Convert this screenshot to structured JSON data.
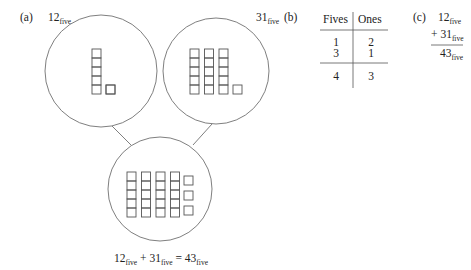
{
  "panel_a": {
    "label": "(a)",
    "left_circle": {
      "value": "12",
      "base": "five",
      "fives_columns": 1,
      "ones_units": 2
    },
    "right_circle": {
      "value": "31",
      "base": "five",
      "fives_columns": 3,
      "ones_units": 1
    },
    "bottom_circle": {
      "fives_columns": 4,
      "ones_units": 3
    },
    "equation": {
      "a": "12",
      "a_base": "five",
      "plus": "+",
      "b": "31",
      "b_base": "five",
      "equals": "=",
      "sum": "43",
      "sum_base": "five"
    }
  },
  "panel_b": {
    "label": "(b)",
    "headers": [
      "Fives",
      "Ones"
    ],
    "rows": [
      [
        "1",
        "2"
      ],
      [
        "3",
        "1"
      ]
    ],
    "total": [
      "4",
      "3"
    ]
  },
  "panel_c": {
    "label": "(c)",
    "addend1": "12",
    "addend1_base": "five",
    "plus": "+",
    "addend2": "31",
    "addend2_base": "five",
    "sum": "43",
    "sum_base": "five"
  },
  "colors": {
    "line": "#6b6b6b",
    "block": "#555555",
    "text": "#222222"
  }
}
